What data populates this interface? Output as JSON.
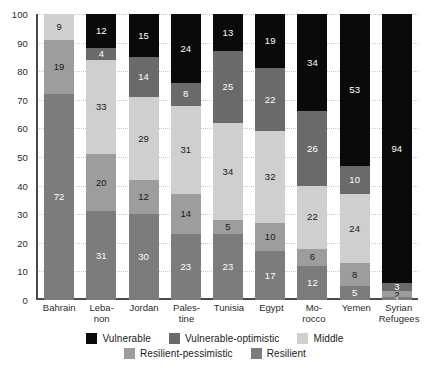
{
  "chart_data": {
    "type": "bar",
    "subtype": "stacked-percentage-column",
    "title": "",
    "xlabel": "",
    "ylabel": "",
    "ylim": [
      0,
      100
    ],
    "yticks": [
      0,
      10,
      20,
      30,
      40,
      50,
      60,
      70,
      80,
      90,
      100
    ],
    "ytick_labels": [
      "0",
      "10",
      "20",
      "30",
      "40",
      "50",
      "60",
      "70",
      "80",
      "90",
      "100"
    ],
    "grid": true,
    "legend_position": "bottom",
    "stack_order_bottom_to_top": [
      "Resilient",
      "Resilient-pessimistic",
      "Middle",
      "Vulnerable-optimistic",
      "Vulnerable"
    ],
    "categories": [
      "Bahrain",
      "Lebanon",
      "Jordan",
      "Palestine",
      "Tunisia",
      "Egypt",
      "Morocco",
      "Yemen",
      "Syrian Refugees"
    ],
    "category_labels": [
      "Bahrain",
      "Leba-\nnon",
      "Jordan",
      "Pales-\ntine",
      "Tunisia",
      "Egypt",
      "Mo-\nrocco",
      "Yemen",
      "Syrian\nRefugees"
    ],
    "series": [
      {
        "name": "Resilient",
        "color": "#7c7c7c",
        "values": [
          72,
          31,
          30,
          23,
          23,
          17,
          12,
          5,
          1
        ]
      },
      {
        "name": "Resilient-pessimistic",
        "color": "#9d9d9d",
        "values": [
          19,
          20,
          12,
          14,
          5,
          10,
          6,
          8,
          2
        ]
      },
      {
        "name": "Middle",
        "color": "#cfcfcf",
        "values": [
          9,
          33,
          29,
          31,
          34,
          32,
          22,
          24,
          0
        ]
      },
      {
        "name": "Vulnerable-optimistic",
        "color": "#6a6a6a",
        "values": [
          0,
          4,
          14,
          8,
          25,
          22,
          26,
          10,
          3
        ]
      },
      {
        "name": "Vulnerable",
        "color": "#0a0a0a",
        "values": [
          0,
          12,
          15,
          24,
          13,
          19,
          34,
          53,
          94
        ]
      }
    ]
  },
  "legend": {
    "rows": [
      [
        {
          "label": "Vulnerable",
          "color": "#0a0a0a"
        },
        {
          "label": "Vulnerable-optimistic",
          "color": "#6a6a6a"
        },
        {
          "label": "Middle",
          "color": "#cfcfcf"
        }
      ],
      [
        {
          "label": "Resilient-pessimistic",
          "color": "#9d9d9d"
        },
        {
          "label": "Resilient",
          "color": "#7c7c7c"
        }
      ]
    ]
  },
  "style": {
    "label_light": "#ffffff",
    "label_dark": "#1a1a1a",
    "axis_color": "#4a4a4a",
    "grid_color": "#c9c9c9",
    "background": "#ffffff"
  }
}
